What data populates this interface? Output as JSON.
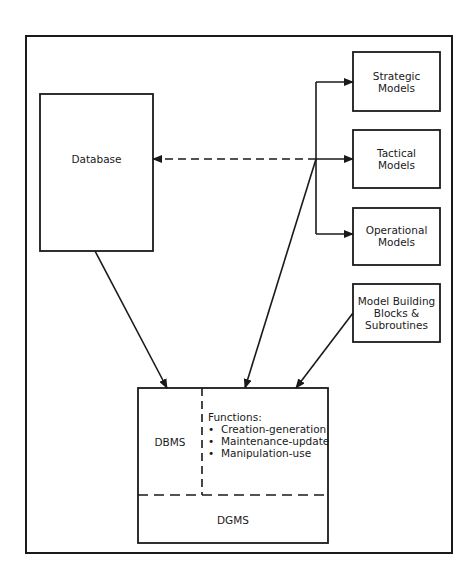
{
  "diagram": {
    "type": "system-architecture",
    "nodes": {
      "database": {
        "label": "Database"
      },
      "strategic": {
        "label_line1": "Strategic",
        "label_line2": "Models"
      },
      "tactical": {
        "label_line1": "Tactical",
        "label_line2": "Models"
      },
      "operational": {
        "label_line1": "Operational",
        "label_line2": "Models"
      },
      "model_building": {
        "label_line1": "Model Building",
        "label_line2": "Blocks &",
        "label_line3": "Subroutines"
      },
      "dbms": {
        "label": "DBMS"
      },
      "dgms": {
        "label": "DGMS"
      },
      "functions": {
        "title": "Functions:",
        "items": [
          "Creation-generation",
          "Maintenance-update",
          "Manipulation-use"
        ],
        "bullet": "•"
      }
    },
    "edges": [
      {
        "from": "database",
        "to": "dbms",
        "style": "solid",
        "arrow": "end"
      },
      {
        "from": "hub",
        "to": "database",
        "style": "dashed",
        "arrow": "end"
      },
      {
        "from": "hub",
        "to": "strategic",
        "style": "solid",
        "arrow": "end"
      },
      {
        "from": "hub",
        "to": "tactical",
        "style": "solid",
        "arrow": "end"
      },
      {
        "from": "hub",
        "to": "operational",
        "style": "solid",
        "arrow": "end"
      },
      {
        "from": "hub",
        "to": "dbms",
        "style": "solid",
        "arrow": "end"
      },
      {
        "from": "model_building",
        "to": "dbms",
        "style": "solid",
        "arrow": "end"
      }
    ],
    "colors": {
      "stroke": "#1a1a1a",
      "background": "#ffffff"
    }
  }
}
